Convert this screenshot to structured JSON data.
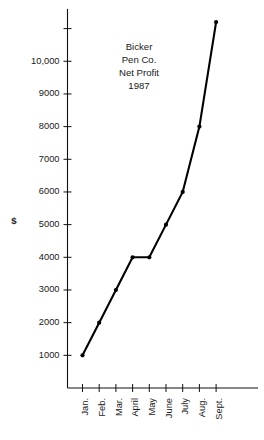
{
  "chart_data": {
    "type": "line",
    "title": "Bicker Pen Co. Net Profit 1987",
    "title_lines": [
      "Bicker",
      "Pen Co.",
      "Net Profit",
      "1987"
    ],
    "xlabel": "",
    "ylabel": "$",
    "categories": [
      "Jan.",
      "Feb.",
      "Mar.",
      "April",
      "May",
      "June",
      "July",
      "Aug.",
      "Sept."
    ],
    "values": [
      1000,
      2000,
      3000,
      4000,
      4000,
      5000,
      6000,
      8000,
      11200
    ],
    "ytick_labels": [
      "1000",
      "2000",
      "3000",
      "4000",
      "5000",
      "6000",
      "7000",
      "8000",
      "9000",
      "10,000"
    ],
    "ytick_values": [
      1000,
      2000,
      3000,
      4000,
      5000,
      6000,
      7000,
      8000,
      9000,
      10000
    ],
    "unlabeled_ytick_values": [
      11000
    ],
    "ylim": [
      0,
      11600
    ],
    "xlim": [
      0,
      10
    ],
    "grid": false,
    "legend": false,
    "marker": "filled-circle",
    "line_color": "#000000",
    "axis_color": "#111111"
  },
  "axis_titles": {
    "y": "$"
  }
}
